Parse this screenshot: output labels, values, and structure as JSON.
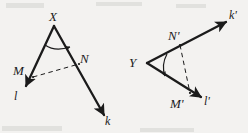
{
  "figure": {
    "background_color": "#f3f2f0",
    "ink_color": "#1b1b1b",
    "width": 248,
    "height": 133,
    "diagrams": [
      {
        "name": "angle-x",
        "vertex_label": "X",
        "ray_labels": [
          "l",
          "k"
        ],
        "point_labels": [
          "M",
          "N"
        ],
        "dashed_segment": "MN",
        "arc_marker": "single-arc-with-arrowhead"
      },
      {
        "name": "angle-y",
        "vertex_label": "Y",
        "ray_labels": [
          "k'",
          "l'"
        ],
        "point_labels": [
          "N'",
          "M'"
        ],
        "dashed_segment": "N'M'",
        "arc_marker": "single-arc-with-arrowhead"
      }
    ]
  },
  "labels": {
    "x_vertex": "X",
    "m_point": "M",
    "n_point": "N",
    "l_ray": "l",
    "k_ray": "k",
    "y_vertex": "Y",
    "n_prime_point": "N'",
    "m_prime_point": "M'",
    "k_prime_ray": "k'",
    "l_prime_ray": "l'"
  }
}
